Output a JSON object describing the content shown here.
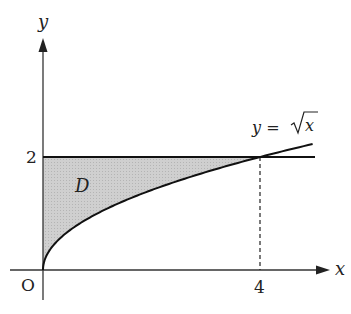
{
  "diagram": {
    "title": "",
    "axes": {
      "x_label": "x",
      "y_label": "y",
      "origin_label": "O"
    },
    "ticks": {
      "x": [
        {
          "value": 4,
          "label": "4"
        }
      ],
      "y": [
        {
          "value": 2,
          "label": "2"
        }
      ]
    },
    "curves": [
      {
        "name": "sqrt-curve",
        "equation": "y = √x",
        "label_prefix": "y =",
        "label_radicand": "x",
        "x_range": [
          0,
          4.97
        ]
      },
      {
        "name": "horizontal-line",
        "equation": "y = 2",
        "x_range": [
          0,
          4.97
        ]
      }
    ],
    "region": {
      "label": "D",
      "description": "Region bounded by y-axis, y = 2 and y = √x for 0 ≤ x ≤ 4",
      "fill_color": "#c8c8c8"
    },
    "intersection": {
      "x": 4,
      "y": 2,
      "dashed_guide": true
    },
    "colors": {
      "stroke": "#111111",
      "axis": "#333333",
      "fill": "#c8c8c8",
      "background": "#ffffff"
    }
  }
}
